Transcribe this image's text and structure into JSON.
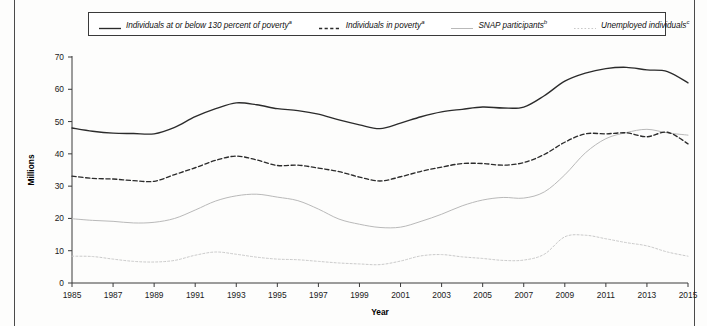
{
  "figure": {
    "y_axis_title": "Millions",
    "x_axis_title": "Year"
  },
  "legend": {
    "items": [
      {
        "label": "Individuals at or below 130 percent of poverty",
        "note": "a",
        "style": "solid-dark",
        "color": "#2b2b2b"
      },
      {
        "label": "Individuals in poverty",
        "note": "a",
        "style": "dashed-dark",
        "color": "#2b2b2b"
      },
      {
        "label": "SNAP participants",
        "note": "b",
        "style": "solid-light",
        "color": "#b9b9b9"
      },
      {
        "label": "Unemployed individuals",
        "note": "c",
        "style": "dotted-light",
        "color": "#c9c9c9"
      }
    ]
  },
  "chart_data": {
    "type": "line",
    "title": "",
    "xlabel": "Year",
    "ylabel": "Millions",
    "ylim": [
      0,
      70
    ],
    "xlim": [
      1985,
      2015
    ],
    "y_ticks": [
      0,
      10,
      20,
      30,
      40,
      50,
      60,
      70
    ],
    "x_ticks": [
      1985,
      1987,
      1989,
      1991,
      1993,
      1995,
      1997,
      1999,
      2001,
      2003,
      2005,
      2007,
      2009,
      2011,
      2013,
      2015
    ],
    "x_tick_labels": [
      "1985",
      "1987",
      "1989",
      "1991",
      "1993",
      "1995",
      "1997",
      "1999",
      "2001",
      "2003",
      "2005",
      "2007",
      "2009",
      "2011",
      "2013",
      "2015"
    ],
    "grid": false,
    "legend_position": "top",
    "x": [
      1985,
      1986,
      1987,
      1988,
      1989,
      1990,
      1991,
      1992,
      1993,
      1994,
      1995,
      1996,
      1997,
      1998,
      1999,
      2000,
      2001,
      2002,
      2003,
      2004,
      2005,
      2006,
      2007,
      2008,
      2009,
      2010,
      2011,
      2012,
      2013,
      2014,
      2015
    ],
    "series": [
      {
        "name": "Individuals at or below 130 percent of poverty",
        "note": "a",
        "style": "solid-dark",
        "color": "#2b2b2b",
        "values": [
          48.0,
          47.0,
          46.4,
          46.3,
          46.2,
          48.2,
          51.5,
          54.0,
          55.8,
          55.2,
          54.0,
          53.4,
          52.3,
          50.5,
          49.0,
          47.8,
          49.5,
          51.5,
          53.0,
          53.8,
          54.5,
          54.2,
          54.5,
          58.0,
          62.5,
          65.0,
          66.4,
          66.8,
          66.0,
          65.5,
          62.0
        ]
      },
      {
        "name": "Individuals in poverty",
        "note": "a",
        "style": "dashed-dark",
        "color": "#2b2b2b",
        "values": [
          33.1,
          32.4,
          32.2,
          31.7,
          31.5,
          33.6,
          35.7,
          38.0,
          39.3,
          38.1,
          36.4,
          36.5,
          35.6,
          34.5,
          32.8,
          31.6,
          32.9,
          34.6,
          35.9,
          37.0,
          37.0,
          36.5,
          37.3,
          39.8,
          43.6,
          46.2,
          46.2,
          46.5,
          45.3,
          46.7,
          43.1
        ]
      },
      {
        "name": "SNAP participants",
        "note": "b",
        "style": "solid-light",
        "color": "#b9b9b9",
        "values": [
          19.9,
          19.4,
          19.1,
          18.6,
          18.8,
          20.0,
          22.6,
          25.4,
          27.0,
          27.5,
          26.6,
          25.5,
          22.9,
          19.8,
          18.2,
          17.2,
          17.3,
          19.1,
          21.3,
          23.9,
          25.7,
          26.5,
          26.3,
          28.2,
          33.5,
          40.3,
          44.7,
          46.6,
          47.6,
          46.5,
          45.8
        ]
      },
      {
        "name": "Unemployed individuals",
        "note": "c",
        "style": "dotted-light",
        "color": "#c9c9c9",
        "values": [
          8.3,
          8.2,
          7.4,
          6.7,
          6.5,
          7.0,
          8.6,
          9.6,
          8.9,
          8.0,
          7.4,
          7.2,
          6.7,
          6.2,
          5.9,
          5.7,
          6.8,
          8.4,
          8.8,
          8.1,
          7.6,
          7.0,
          7.1,
          8.9,
          14.3,
          14.8,
          13.7,
          12.5,
          11.5,
          9.6,
          8.3
        ]
      }
    ]
  }
}
